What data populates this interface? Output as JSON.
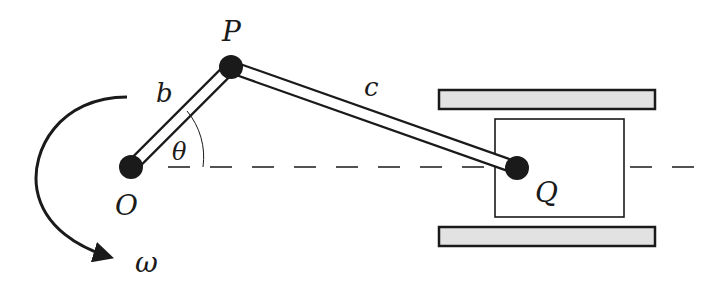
{
  "diagram": {
    "labels": {
      "pivot": "O",
      "crank_pin": "P",
      "slider_pin": "Q",
      "crank_length": "b",
      "rod_length": "c",
      "angle": "θ",
      "angular_velocity": "ω"
    },
    "colors": {
      "ink": "#1a1a1a",
      "guide_fill": "#e2e2e2",
      "background": "#ffffff"
    },
    "nodes": {
      "O": {
        "x": 131,
        "y": 167
      },
      "P": {
        "x": 231,
        "y": 67
      },
      "Q": {
        "x": 517,
        "y": 168
      }
    }
  }
}
